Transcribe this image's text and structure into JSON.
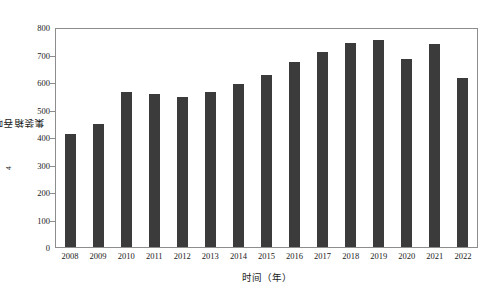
{
  "chart_data": {
    "type": "bar",
    "title": "",
    "xlabel": "时间（年）",
    "ylabel": "集装箱吞吐量（×10⁴t）",
    "ylabel_main": "集装箱吞吐量（×10",
    "ylabel_exp": "4",
    "ylabel_tail": "t）",
    "categories": [
      "2008",
      "2009",
      "2010",
      "2011",
      "2012",
      "2013",
      "2014",
      "2015",
      "2016",
      "2017",
      "2018",
      "2019",
      "2020",
      "2021",
      "2022"
    ],
    "values": [
      415,
      450,
      570,
      560,
      550,
      568,
      598,
      632,
      678,
      715,
      748,
      760,
      690,
      745,
      620
    ],
    "ylim": [
      0,
      800
    ],
    "yticks": [
      0,
      100,
      200,
      300,
      400,
      500,
      600,
      700,
      800
    ],
    "ytick_labels": [
      "0",
      "100",
      "200",
      "300",
      "400",
      "500",
      "600",
      "700",
      "800"
    ],
    "grid": false,
    "legend": "none",
    "bar_color": "#3b3b3b",
    "axis_color": "#8d8d8d",
    "background_color": "#ffffff"
  }
}
